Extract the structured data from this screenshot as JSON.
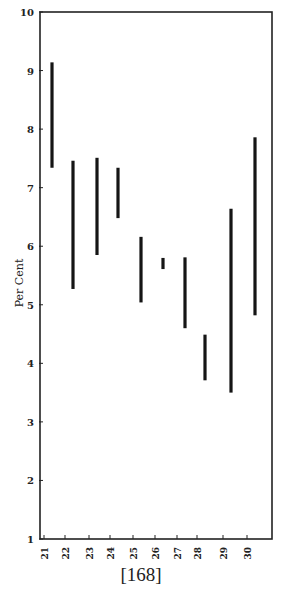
{
  "chart_data": {
    "type": "range-bar",
    "title": "",
    "xlabel": "",
    "ylabel": "Per Cent",
    "ylim": [
      1,
      10
    ],
    "yticks": [
      1,
      2,
      3,
      4,
      5,
      6,
      7,
      8,
      9,
      10
    ],
    "grid": false,
    "legend": null,
    "categories": [
      "1921",
      "1922",
      "1923",
      "1924",
      "1925",
      "1926",
      "1927",
      "1928",
      "1929",
      "1930"
    ],
    "series": [
      {
        "name": "High",
        "values": [
          9.14,
          7.46,
          7.51,
          7.34,
          6.16,
          5.8,
          5.81,
          4.49,
          6.64,
          7.86
        ]
      },
      {
        "name": "Low",
        "values": [
          7.34,
          5.27,
          5.85,
          6.48,
          5.04,
          5.61,
          4.6,
          3.71,
          3.5,
          4.82
        ]
      }
    ]
  },
  "page": {
    "number": "[168]"
  },
  "colors": {
    "bar": "#151515",
    "axis": "#222222",
    "background": "#ffffff"
  }
}
